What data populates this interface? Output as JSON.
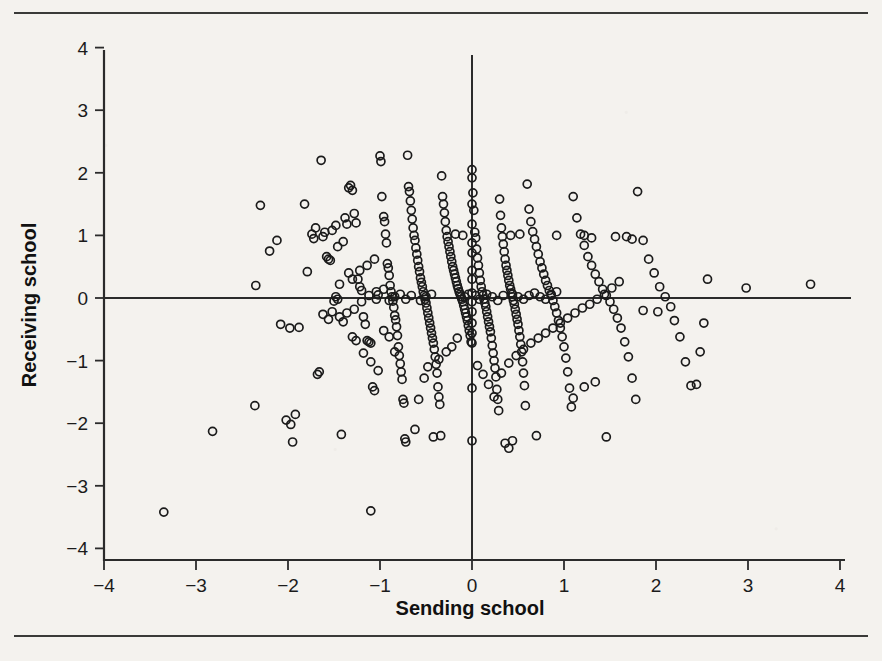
{
  "figure": {
    "background_color": "#f4f2ee",
    "rule_color": "#3a3a38",
    "top_rule_name": "top-horizontal-rule",
    "bottom_rule_name": "bottom-horizontal-rule"
  },
  "chart_data": {
    "type": "scatter",
    "title": "",
    "xlabel": "Sending school",
    "ylabel": "Receiving school",
    "xlim": [
      -4.3,
      4.3
    ],
    "ylim": [
      -4.3,
      4.4
    ],
    "xticks": [
      -4,
      -3,
      -2,
      -1,
      0,
      1,
      2,
      3,
      4
    ],
    "yticks": [
      4,
      3,
      2,
      1,
      0,
      -1,
      -2,
      -3,
      -4
    ],
    "xticklabels": [
      "-4",
      "-3",
      "-2",
      "-1",
      "0",
      "1",
      "2",
      "3",
      "4"
    ],
    "yticklabels": [
      "4",
      "3",
      "2",
      "1",
      "0",
      "-1",
      "-2",
      "-3",
      "-4"
    ],
    "grid": false,
    "legend": null,
    "reference_lines": [
      {
        "orientation": "horizontal",
        "value": 0
      },
      {
        "orientation": "vertical",
        "value": 0
      }
    ],
    "marker": {
      "shape": "open-circle",
      "radius_px": 4.0,
      "stroke": "#1b1b1b",
      "fill": "none"
    },
    "n_points": 388,
    "points": [
      [
        -3.35,
        -3.42
      ],
      [
        -2.82,
        -2.13
      ],
      [
        -2.36,
        -1.72
      ],
      [
        -2.35,
        0.2
      ],
      [
        -2.3,
        1.48
      ],
      [
        -2.12,
        0.92
      ],
      [
        -2.2,
        0.75
      ],
      [
        -2.02,
        -1.95
      ],
      [
        -1.97,
        -2.02
      ],
      [
        -1.92,
        -1.86
      ],
      [
        -1.95,
        -2.3
      ],
      [
        -1.88,
        -0.47
      ],
      [
        -1.82,
        1.5
      ],
      [
        -1.79,
        0.42
      ],
      [
        -1.74,
        1.02
      ],
      [
        -1.72,
        0.95
      ],
      [
        -1.7,
        1.12
      ],
      [
        -1.68,
        -1.22
      ],
      [
        -1.66,
        -1.18
      ],
      [
        -1.64,
        2.2
      ],
      [
        -1.62,
        0.98
      ],
      [
        -1.6,
        1.05
      ],
      [
        -1.58,
        0.66
      ],
      [
        -1.56,
        0.62
      ],
      [
        -1.54,
        0.6
      ],
      [
        -1.52,
        -0.22
      ],
      [
        -1.5,
        -0.05
      ],
      [
        -1.48,
        0.02
      ],
      [
        -1.46,
        -0.02
      ],
      [
        -1.44,
        0.22
      ],
      [
        -1.42,
        -2.18
      ],
      [
        -1.4,
        -0.38
      ],
      [
        -1.38,
        1.28
      ],
      [
        -1.36,
        1.18
      ],
      [
        -1.34,
        1.76
      ],
      [
        -1.32,
        1.8
      ],
      [
        -1.3,
        1.72
      ],
      [
        -1.28,
        1.35
      ],
      [
        -1.26,
        1.2
      ],
      [
        -1.24,
        0.3
      ],
      [
        -1.22,
        0.18
      ],
      [
        -1.2,
        0.12
      ],
      [
        -1.18,
        -0.3
      ],
      [
        -1.16,
        -0.42
      ],
      [
        -1.14,
        -0.68
      ],
      [
        -1.12,
        -0.7
      ],
      [
        -1.1,
        -0.72
      ],
      [
        -1.1,
        -3.4
      ],
      [
        -1.08,
        -1.42
      ],
      [
        -1.06,
        -1.48
      ],
      [
        -1.04,
        -0.02
      ],
      [
        -1.02,
        0.05
      ],
      [
        -1.0,
        2.27
      ],
      [
        -0.99,
        2.18
      ],
      [
        -0.98,
        1.62
      ],
      [
        -0.96,
        1.3
      ],
      [
        -0.95,
        1.22
      ],
      [
        -0.94,
        1.02
      ],
      [
        -0.93,
        0.88
      ],
      [
        -0.92,
        0.55
      ],
      [
        -0.91,
        0.48
      ],
      [
        -0.9,
        0.36
      ],
      [
        -0.89,
        0.2
      ],
      [
        -0.88,
        0.1
      ],
      [
        -0.87,
        0.02
      ],
      [
        -0.86,
        -0.05
      ],
      [
        -0.85,
        -0.15
      ],
      [
        -0.84,
        -0.28
      ],
      [
        -0.83,
        -0.35
      ],
      [
        -0.82,
        -0.46
      ],
      [
        -0.81,
        -0.6
      ],
      [
        -0.8,
        -0.78
      ],
      [
        -0.79,
        -0.92
      ],
      [
        -0.78,
        -1.05
      ],
      [
        -0.77,
        -1.18
      ],
      [
        -0.76,
        -1.3
      ],
      [
        -0.75,
        -1.62
      ],
      [
        -0.74,
        -1.68
      ],
      [
        -0.73,
        -2.25
      ],
      [
        -0.72,
        -2.3
      ],
      [
        -0.7,
        2.28
      ],
      [
        -0.69,
        1.78
      ],
      [
        -0.68,
        1.7
      ],
      [
        -0.67,
        1.55
      ],
      [
        -0.66,
        1.4
      ],
      [
        -0.65,
        1.26
      ],
      [
        -0.64,
        1.12
      ],
      [
        -0.63,
        1.0
      ],
      [
        -0.62,
        0.92
      ],
      [
        -0.61,
        0.8
      ],
      [
        -0.6,
        0.7
      ],
      [
        -0.59,
        0.6
      ],
      [
        -0.58,
        0.5
      ],
      [
        -0.57,
        0.42
      ],
      [
        -0.56,
        0.32
      ],
      [
        -0.55,
        0.25
      ],
      [
        -0.54,
        0.18
      ],
      [
        -0.53,
        0.1
      ],
      [
        -0.52,
        0.04
      ],
      [
        -0.51,
        -0.02
      ],
      [
        -0.5,
        -0.08
      ],
      [
        -0.49,
        -0.16
      ],
      [
        -0.48,
        -0.24
      ],
      [
        -0.47,
        -0.32
      ],
      [
        -0.46,
        -0.4
      ],
      [
        -0.45,
        -0.48
      ],
      [
        -0.44,
        -0.56
      ],
      [
        -0.43,
        -0.64
      ],
      [
        -0.42,
        -0.72
      ],
      [
        -0.41,
        -0.82
      ],
      [
        -0.4,
        -0.94
      ],
      [
        -0.39,
        -1.06
      ],
      [
        -0.38,
        -1.2
      ],
      [
        -0.37,
        -1.42
      ],
      [
        -0.36,
        -1.58
      ],
      [
        -0.35,
        -1.7
      ],
      [
        -0.34,
        -2.2
      ],
      [
        -0.33,
        1.95
      ],
      [
        -0.32,
        1.62
      ],
      [
        -0.31,
        1.5
      ],
      [
        -0.3,
        1.36
      ],
      [
        -0.29,
        1.22
      ],
      [
        -0.28,
        1.08
      ],
      [
        -0.27,
        0.98
      ],
      [
        -0.26,
        0.9
      ],
      [
        -0.25,
        0.82
      ],
      [
        -0.24,
        0.74
      ],
      [
        -0.23,
        0.66
      ],
      [
        -0.22,
        0.58
      ],
      [
        -0.21,
        0.5
      ],
      [
        -0.2,
        0.44
      ],
      [
        -0.19,
        0.38
      ],
      [
        -0.18,
        0.32
      ],
      [
        -0.17,
        0.26
      ],
      [
        -0.16,
        0.2
      ],
      [
        -0.15,
        0.15
      ],
      [
        -0.14,
        0.1
      ],
      [
        -0.13,
        0.06
      ],
      [
        -0.12,
        0.02
      ],
      [
        -0.11,
        -0.02
      ],
      [
        -0.1,
        -0.06
      ],
      [
        -0.09,
        -0.12
      ],
      [
        -0.08,
        -0.18
      ],
      [
        -0.07,
        -0.24
      ],
      [
        -0.06,
        -0.3
      ],
      [
        -0.05,
        -0.36
      ],
      [
        -0.04,
        -0.44
      ],
      [
        -0.03,
        -0.52
      ],
      [
        -0.02,
        -0.6
      ],
      [
        -0.01,
        -0.7
      ],
      [
        0.0,
        2.05
      ],
      [
        0.0,
        1.92
      ],
      [
        0.0,
        1.5
      ],
      [
        0.0,
        1.18
      ],
      [
        0.0,
        0.88
      ],
      [
        0.0,
        0.72
      ],
      [
        0.0,
        0.44
      ],
      [
        0.0,
        0.3
      ],
      [
        0.0,
        0.08
      ],
      [
        0.0,
        -0.06
      ],
      [
        0.0,
        -0.22
      ],
      [
        0.0,
        -0.4
      ],
      [
        0.0,
        -0.56
      ],
      [
        0.0,
        -0.72
      ],
      [
        0.0,
        -1.44
      ],
      [
        0.0,
        -2.28
      ],
      [
        0.01,
        1.68
      ],
      [
        0.02,
        1.4
      ],
      [
        0.03,
        1.05
      ],
      [
        0.04,
        0.96
      ],
      [
        0.05,
        0.78
      ],
      [
        0.06,
        0.64
      ],
      [
        0.07,
        0.52
      ],
      [
        0.08,
        0.4
      ],
      [
        0.09,
        0.28
      ],
      [
        0.1,
        0.18
      ],
      [
        0.11,
        0.1
      ],
      [
        0.12,
        0.04
      ],
      [
        0.13,
        -0.02
      ],
      [
        0.14,
        -0.08
      ],
      [
        0.15,
        -0.14
      ],
      [
        0.16,
        -0.22
      ],
      [
        0.17,
        -0.3
      ],
      [
        0.18,
        -0.38
      ],
      [
        0.19,
        -0.46
      ],
      [
        0.2,
        -0.54
      ],
      [
        0.21,
        -0.64
      ],
      [
        0.22,
        -0.76
      ],
      [
        0.23,
        -0.88
      ],
      [
        0.24,
        -1.0
      ],
      [
        0.25,
        -1.12
      ],
      [
        0.26,
        -1.26
      ],
      [
        0.27,
        -1.46
      ],
      [
        0.28,
        -1.62
      ],
      [
        0.29,
        -1.8
      ],
      [
        0.3,
        1.58
      ],
      [
        0.31,
        1.32
      ],
      [
        0.32,
        1.12
      ],
      [
        0.33,
        0.98
      ],
      [
        0.34,
        0.86
      ],
      [
        0.35,
        0.74
      ],
      [
        0.36,
        0.62
      ],
      [
        0.37,
        0.52
      ],
      [
        0.38,
        0.44
      ],
      [
        0.39,
        0.36
      ],
      [
        0.4,
        0.28
      ],
      [
        0.41,
        0.2
      ],
      [
        0.42,
        0.14
      ],
      [
        0.43,
        0.08
      ],
      [
        0.44,
        0.02
      ],
      [
        0.45,
        -0.04
      ],
      [
        0.46,
        -0.1
      ],
      [
        0.47,
        -0.18
      ],
      [
        0.48,
        -0.26
      ],
      [
        0.49,
        -0.34
      ],
      [
        0.5,
        -0.42
      ],
      [
        0.51,
        -0.52
      ],
      [
        0.52,
        -0.62
      ],
      [
        0.53,
        -0.74
      ],
      [
        0.54,
        -0.86
      ],
      [
        0.55,
        -1.02
      ],
      [
        0.56,
        -1.2
      ],
      [
        0.57,
        -1.4
      ],
      [
        0.58,
        -1.72
      ],
      [
        0.6,
        1.82
      ],
      [
        0.62,
        1.42
      ],
      [
        0.64,
        1.22
      ],
      [
        0.66,
        1.06
      ],
      [
        0.68,
        0.94
      ],
      [
        0.7,
        0.82
      ],
      [
        0.72,
        0.7
      ],
      [
        0.74,
        0.58
      ],
      [
        0.76,
        0.48
      ],
      [
        0.78,
        0.38
      ],
      [
        0.8,
        0.28
      ],
      [
        0.82,
        0.2
      ],
      [
        0.84,
        0.12
      ],
      [
        0.86,
        0.04
      ],
      [
        0.88,
        -0.04
      ],
      [
        0.9,
        -0.14
      ],
      [
        0.92,
        -0.24
      ],
      [
        0.94,
        -0.36
      ],
      [
        0.96,
        -0.48
      ],
      [
        0.98,
        -0.62
      ],
      [
        1.0,
        -0.78
      ],
      [
        1.02,
        -0.96
      ],
      [
        1.04,
        -1.18
      ],
      [
        1.06,
        -1.44
      ],
      [
        1.08,
        -1.74
      ],
      [
        1.1,
        1.62
      ],
      [
        1.14,
        1.28
      ],
      [
        1.18,
        1.02
      ],
      [
        1.22,
        0.84
      ],
      [
        1.26,
        0.66
      ],
      [
        1.3,
        0.52
      ],
      [
        1.34,
        0.38
      ],
      [
        1.38,
        0.26
      ],
      [
        1.42,
        0.14
      ],
      [
        1.46,
        0.04
      ],
      [
        1.5,
        -0.06
      ],
      [
        1.54,
        -0.18
      ],
      [
        1.58,
        -0.32
      ],
      [
        1.62,
        -0.48
      ],
      [
        1.66,
        -0.7
      ],
      [
        1.7,
        -0.94
      ],
      [
        1.74,
        -1.28
      ],
      [
        1.78,
        -1.62
      ],
      [
        1.8,
        1.7
      ],
      [
        1.86,
        0.92
      ],
      [
        1.92,
        0.62
      ],
      [
        1.98,
        0.4
      ],
      [
        2.04,
        0.18
      ],
      [
        2.1,
        0.02
      ],
      [
        2.16,
        -0.14
      ],
      [
        2.2,
        -0.36
      ],
      [
        2.26,
        -0.62
      ],
      [
        2.32,
        -1.02
      ],
      [
        2.38,
        -1.4
      ],
      [
        2.44,
        -1.38
      ],
      [
        2.48,
        -0.86
      ],
      [
        2.52,
        -0.4
      ],
      [
        2.56,
        0.3
      ],
      [
        2.98,
        0.16
      ],
      [
        3.68,
        0.22
      ],
      [
        -1.3,
        -0.62
      ],
      [
        -1.26,
        -0.68
      ],
      [
        -1.18,
        -0.88
      ],
      [
        -1.1,
        -1.02
      ],
      [
        -1.02,
        -1.16
      ],
      [
        -0.96,
        -0.52
      ],
      [
        -0.9,
        -0.62
      ],
      [
        -0.84,
        -0.86
      ],
      [
        -1.34,
        0.4
      ],
      [
        -1.3,
        0.3
      ],
      [
        -1.22,
        0.44
      ],
      [
        -1.14,
        0.52
      ],
      [
        -1.06,
        0.62
      ],
      [
        -1.46,
        0.82
      ],
      [
        -1.4,
        0.9
      ],
      [
        -1.52,
        1.08
      ],
      [
        -1.48,
        1.16
      ],
      [
        -0.62,
        -2.1
      ],
      [
        -0.58,
        -1.62
      ],
      [
        -0.52,
        -1.28
      ],
      [
        -0.48,
        -1.1
      ],
      [
        -0.42,
        -2.22
      ],
      [
        -0.36,
        -0.98
      ],
      [
        -0.28,
        -0.86
      ],
      [
        -0.22,
        -0.78
      ],
      [
        -0.16,
        -0.64
      ],
      [
        0.06,
        -1.08
      ],
      [
        0.12,
        -1.22
      ],
      [
        0.18,
        -1.38
      ],
      [
        0.24,
        -1.58
      ],
      [
        0.32,
        -1.2
      ],
      [
        0.4,
        -1.04
      ],
      [
        0.48,
        -0.92
      ],
      [
        0.56,
        -0.82
      ],
      [
        0.64,
        -0.72
      ],
      [
        0.72,
        -0.64
      ],
      [
        0.8,
        -0.56
      ],
      [
        0.88,
        -0.48
      ],
      [
        0.96,
        -0.4
      ],
      [
        1.04,
        -0.32
      ],
      [
        1.12,
        -0.24
      ],
      [
        1.2,
        -0.16
      ],
      [
        1.28,
        -0.1
      ],
      [
        1.36,
        -0.02
      ],
      [
        1.44,
        0.06
      ],
      [
        1.52,
        0.16
      ],
      [
        1.6,
        0.26
      ],
      [
        1.1,
        -1.6
      ],
      [
        1.22,
        -1.42
      ],
      [
        1.34,
        -1.34
      ],
      [
        0.7,
        -2.2
      ],
      [
        1.46,
        -2.22
      ],
      [
        0.62,
        0.04
      ],
      [
        0.68,
        0.08
      ],
      [
        0.74,
        0.02
      ],
      [
        0.8,
        -0.02
      ],
      [
        0.86,
        0.06
      ],
      [
        0.92,
        0.1
      ],
      [
        0.44,
        0.06
      ],
      [
        0.5,
        0.02
      ],
      [
        0.56,
        -0.02
      ],
      [
        -0.66,
        0.04
      ],
      [
        -0.72,
        -0.02
      ],
      [
        -0.78,
        0.06
      ],
      [
        -0.84,
        0.02
      ],
      [
        -0.9,
        -0.04
      ],
      [
        -0.44,
        0.06
      ],
      [
        -0.5,
        0.02
      ],
      [
        -0.56,
        -0.04
      ],
      [
        -0.04,
        0.06
      ],
      [
        -0.08,
        0.02
      ],
      [
        0.04,
        0.04
      ],
      [
        0.08,
        -0.02
      ],
      [
        0.16,
        0.06
      ],
      [
        0.22,
        0.02
      ],
      [
        0.28,
        -0.04
      ],
      [
        0.34,
        0.04
      ],
      [
        -1.62,
        -0.26
      ],
      [
        -1.56,
        -0.34
      ],
      [
        -1.44,
        -0.3
      ],
      [
        -1.36,
        -0.24
      ],
      [
        -1.28,
        -0.18
      ],
      [
        -1.2,
        -0.06
      ],
      [
        -1.12,
        0.04
      ],
      [
        -1.04,
        0.1
      ],
      [
        -0.96,
        0.14
      ],
      [
        1.68,
        0.98
      ],
      [
        1.74,
        0.94
      ],
      [
        1.56,
        0.98
      ],
      [
        1.22,
        1.0
      ],
      [
        1.3,
        0.96
      ],
      [
        0.42,
        1.0
      ],
      [
        0.52,
        1.02
      ],
      [
        0.92,
        1.0
      ],
      [
        -0.1,
        1.0
      ],
      [
        -0.18,
        1.02
      ],
      [
        1.86,
        -0.2
      ],
      [
        2.02,
        -0.22
      ],
      [
        -2.08,
        -0.42
      ],
      [
        -1.98,
        -0.48
      ],
      [
        0.36,
        -2.32
      ],
      [
        0.44,
        -2.28
      ],
      [
        0.4,
        -2.4
      ]
    ]
  },
  "axes": {
    "y_axis_name": "y-axis",
    "x_axis_name": "x-axis"
  }
}
